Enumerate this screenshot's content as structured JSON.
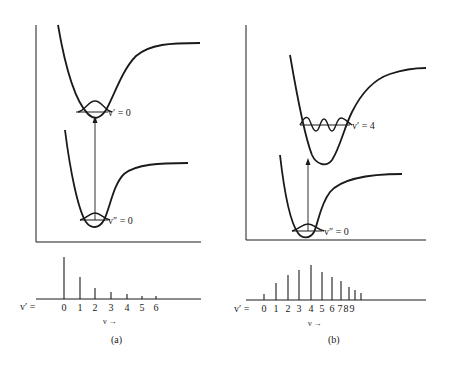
{
  "panels": [
    {
      "id": "a",
      "caption": "(a)",
      "upper_state_label": "v′ = 0",
      "lower_state_label": "v″ = 0",
      "spectrum": {
        "axis_prefix": "v′ =",
        "axis_label": "ν →",
        "lines": [
          {
            "v": "0",
            "x": 64,
            "top": 257
          },
          {
            "v": "1",
            "x": 80,
            "top": 277
          },
          {
            "v": "2",
            "x": 95,
            "top": 288
          },
          {
            "v": "3",
            "x": 111,
            "top": 292
          },
          {
            "v": "4",
            "x": 127,
            "top": 294
          },
          {
            "v": "5",
            "x": 142,
            "top": 296
          },
          {
            "v": "6",
            "x": 156,
            "top": 296
          }
        ]
      }
    },
    {
      "id": "b",
      "caption": "(b)",
      "upper_state_label": "v′ = 4",
      "lower_state_label": "v″ = 0",
      "spectrum": {
        "axis_prefix": "v′ =",
        "axis_label": "ν →",
        "tick_text": "0 1 2 3 4 5 6 789",
        "lines": [
          {
            "v": "0",
            "x": 264,
            "top": 294
          },
          {
            "v": "1",
            "x": 276,
            "top": 283
          },
          {
            "v": "2",
            "x": 288,
            "top": 275
          },
          {
            "v": "3",
            "x": 299,
            "top": 270
          },
          {
            "v": "4",
            "x": 311,
            "top": 265
          },
          {
            "v": "5",
            "x": 322,
            "top": 272
          },
          {
            "v": "6",
            "x": 332,
            "top": 277
          },
          {
            "v": "7",
            "x": 341,
            "top": 281
          },
          {
            "v": "8",
            "x": 349,
            "top": 287
          },
          {
            "v": "9",
            "x": 355,
            "top": 290
          },
          {
            "v": "",
            "x": 361,
            "top": 293
          }
        ]
      }
    }
  ],
  "labels": {
    "a_upper": "v′ = 0",
    "a_lower": "v″ = 0",
    "a_prefix": "v′ =",
    "a_nu": "ν →",
    "a_caption": "(a)",
    "a_ticks": [
      "0",
      "1",
      "2",
      "3",
      "4",
      "5",
      "6"
    ],
    "b_upper": "v′ = 4",
    "b_lower": "v″ = 0",
    "b_prefix": "v′ =",
    "b_nu": "ν →",
    "b_caption": "(b)",
    "b_ticks": [
      "0",
      "1",
      "2",
      "3",
      "4",
      "5",
      "6",
      "7",
      "8",
      "9"
    ]
  }
}
